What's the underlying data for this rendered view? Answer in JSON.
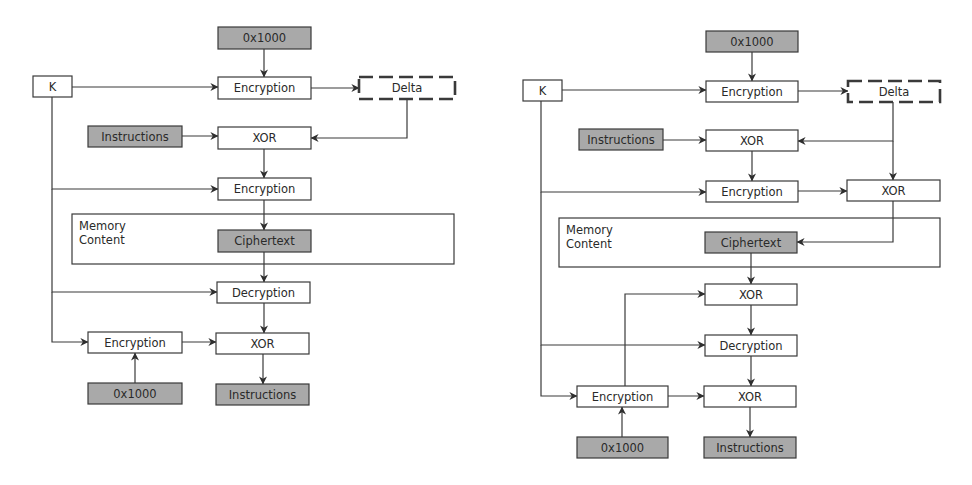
{
  "colors": {
    "box_fill": "#ffffff",
    "shaded_fill": "#a9a9a9",
    "stroke": "#3a3a3a",
    "text": "#2a2a2a",
    "background": "#ffffff"
  },
  "diagrams": [
    {
      "id": "left-scheme",
      "memory_label": [
        "Memory",
        "Content"
      ],
      "memory_box": {
        "x": 72,
        "y": 214,
        "w": 382,
        "h": 50
      },
      "nodes": [
        {
          "id": "k",
          "label": "K",
          "x": 33,
          "y": 76,
          "w": 39,
          "h": 21,
          "style": "plain"
        },
        {
          "id": "addr-top",
          "label": "0x1000",
          "x": 218,
          "y": 27,
          "w": 93,
          "h": 22,
          "style": "shaded"
        },
        {
          "id": "enc1",
          "label": "Encryption",
          "x": 218,
          "y": 77,
          "w": 93,
          "h": 22,
          "style": "plain"
        },
        {
          "id": "delta",
          "label": "Delta",
          "x": 359,
          "y": 77,
          "w": 96,
          "h": 22,
          "style": "dashed"
        },
        {
          "id": "instr-in",
          "label": "Instructions",
          "x": 88,
          "y": 126,
          "w": 94,
          "h": 21,
          "style": "shaded"
        },
        {
          "id": "xor1",
          "label": "XOR",
          "x": 218,
          "y": 127,
          "w": 93,
          "h": 22,
          "style": "plain"
        },
        {
          "id": "enc2",
          "label": "Encryption",
          "x": 218,
          "y": 178,
          "w": 93,
          "h": 22,
          "style": "plain"
        },
        {
          "id": "cipher",
          "label": "Ciphertext",
          "x": 218,
          "y": 230,
          "w": 93,
          "h": 22,
          "style": "shaded"
        },
        {
          "id": "dec",
          "label": "Decryption",
          "x": 217,
          "y": 282,
          "w": 93,
          "h": 21,
          "style": "plain"
        },
        {
          "id": "enc3",
          "label": "Encryption",
          "x": 88,
          "y": 332,
          "w": 94,
          "h": 21,
          "style": "plain"
        },
        {
          "id": "xor2",
          "label": "XOR",
          "x": 216,
          "y": 333,
          "w": 93,
          "h": 21,
          "style": "plain"
        },
        {
          "id": "addr-bot",
          "label": "0x1000",
          "x": 88,
          "y": 383,
          "w": 94,
          "h": 21,
          "style": "shaded"
        },
        {
          "id": "instr-out",
          "label": "Instructions",
          "x": 216,
          "y": 384,
          "w": 93,
          "h": 21,
          "style": "shaded"
        }
      ],
      "edges": [
        {
          "points": [
            [
              264,
              49
            ],
            [
              264,
              77
            ]
          ],
          "arrow": true
        },
        {
          "points": [
            [
              72,
              87
            ],
            [
              218,
              87
            ]
          ],
          "arrow": true
        },
        {
          "points": [
            [
              311,
              88
            ],
            [
              359,
              88
            ]
          ],
          "arrow": true
        },
        {
          "points": [
            [
              407,
              99
            ],
            [
              407,
              138
            ],
            [
              311,
              138
            ]
          ],
          "arrow": true
        },
        {
          "points": [
            [
              182,
              136
            ],
            [
              218,
              136
            ]
          ],
          "arrow": true
        },
        {
          "points": [
            [
              264,
              149
            ],
            [
              264,
              178
            ]
          ],
          "arrow": true
        },
        {
          "points": [
            [
              52,
              97
            ],
            [
              52,
              189
            ],
            [
              218,
              189
            ]
          ],
          "arrow": true
        },
        {
          "points": [
            [
              264,
              200
            ],
            [
              264,
              230
            ]
          ],
          "arrow": true
        },
        {
          "points": [
            [
              264,
              252
            ],
            [
              264,
              282
            ]
          ],
          "arrow": true
        },
        {
          "points": [
            [
              52,
              189
            ],
            [
              52,
              292
            ],
            [
              217,
              292
            ]
          ],
          "arrow": true
        },
        {
          "points": [
            [
              52,
              292
            ],
            [
              52,
              342
            ],
            [
              88,
              342
            ]
          ],
          "arrow": true
        },
        {
          "points": [
            [
              264,
              303
            ],
            [
              264,
              333
            ]
          ],
          "arrow": true
        },
        {
          "points": [
            [
              182,
              342
            ],
            [
              216,
              342
            ]
          ],
          "arrow": true
        },
        {
          "points": [
            [
              135,
              383
            ],
            [
              135,
              353
            ]
          ],
          "arrow": true
        },
        {
          "points": [
            [
              263,
              354
            ],
            [
              263,
              384
            ]
          ],
          "arrow": true
        }
      ]
    },
    {
      "id": "right-scheme",
      "memory_label": [
        "Memory",
        "Content"
      ],
      "memory_box": {
        "x": 559,
        "y": 218,
        "w": 381,
        "h": 49
      },
      "nodes": [
        {
          "id": "k",
          "label": "K",
          "x": 523,
          "y": 80,
          "w": 39,
          "h": 21,
          "style": "plain"
        },
        {
          "id": "addr-top",
          "label": "0x1000",
          "x": 706,
          "y": 31,
          "w": 92,
          "h": 21,
          "style": "shaded"
        },
        {
          "id": "enc1",
          "label": "Encryption",
          "x": 706,
          "y": 81,
          "w": 92,
          "h": 21,
          "style": "plain"
        },
        {
          "id": "delta",
          "label": "Delta",
          "x": 848,
          "y": 81,
          "w": 92,
          "h": 21,
          "style": "dashed"
        },
        {
          "id": "instr-in",
          "label": "Instructions",
          "x": 579,
          "y": 129,
          "w": 84,
          "h": 21,
          "style": "shaded"
        },
        {
          "id": "xor1",
          "label": "XOR",
          "x": 706,
          "y": 130,
          "w": 92,
          "h": 21,
          "style": "plain"
        },
        {
          "id": "enc2",
          "label": "Encryption",
          "x": 706,
          "y": 181,
          "w": 92,
          "h": 21,
          "style": "plain"
        },
        {
          "id": "xor-delta",
          "label": "XOR",
          "x": 847,
          "y": 180,
          "w": 93,
          "h": 21,
          "style": "plain"
        },
        {
          "id": "cipher",
          "label": "Ciphertext",
          "x": 705,
          "y": 232,
          "w": 92,
          "h": 21,
          "style": "shaded"
        },
        {
          "id": "xor2",
          "label": "XOR",
          "x": 705,
          "y": 284,
          "w": 92,
          "h": 21,
          "style": "plain"
        },
        {
          "id": "dec",
          "label": "Decryption",
          "x": 705,
          "y": 335,
          "w": 92,
          "h": 21,
          "style": "plain"
        },
        {
          "id": "enc3",
          "label": "Encryption",
          "x": 577,
          "y": 386,
          "w": 91,
          "h": 21,
          "style": "plain"
        },
        {
          "id": "xor3",
          "label": "XOR",
          "x": 704,
          "y": 386,
          "w": 92,
          "h": 21,
          "style": "plain"
        },
        {
          "id": "addr-bot",
          "label": "0x1000",
          "x": 577,
          "y": 437,
          "w": 91,
          "h": 21,
          "style": "shaded"
        },
        {
          "id": "instr-out",
          "label": "Instructions",
          "x": 704,
          "y": 437,
          "w": 92,
          "h": 21,
          "style": "shaded"
        }
      ],
      "edges": [
        {
          "points": [
            [
              752,
              52
            ],
            [
              752,
              81
            ]
          ],
          "arrow": true
        },
        {
          "points": [
            [
              562,
              90
            ],
            [
              706,
              90
            ]
          ],
          "arrow": true
        },
        {
          "points": [
            [
              798,
              91
            ],
            [
              848,
              91
            ]
          ],
          "arrow": true
        },
        {
          "points": [
            [
              893,
              102
            ],
            [
              893,
              141
            ],
            [
              798,
              141
            ]
          ],
          "arrow": true
        },
        {
          "points": [
            [
              893,
              141
            ],
            [
              893,
              180
            ]
          ],
          "arrow": true
        },
        {
          "points": [
            [
              663,
              140
            ],
            [
              706,
              140
            ]
          ],
          "arrow": true
        },
        {
          "points": [
            [
              752,
              151
            ],
            [
              752,
              181
            ]
          ],
          "arrow": true
        },
        {
          "points": [
            [
              541,
              101
            ],
            [
              541,
              192
            ],
            [
              706,
              192
            ]
          ],
          "arrow": true
        },
        {
          "points": [
            [
              798,
              191
            ],
            [
              847,
              191
            ]
          ],
          "arrow": true
        },
        {
          "points": [
            [
              893,
              201
            ],
            [
              893,
              242
            ],
            [
              797,
              242
            ]
          ],
          "arrow": true
        },
        {
          "points": [
            [
              751,
              253
            ],
            [
              751,
              284
            ]
          ],
          "arrow": true
        },
        {
          "points": [
            [
              625,
              386
            ],
            [
              625,
              294
            ],
            [
              705,
              294
            ]
          ],
          "arrow": true
        },
        {
          "points": [
            [
              751,
              305
            ],
            [
              751,
              335
            ]
          ],
          "arrow": true
        },
        {
          "points": [
            [
              541,
              192
            ],
            [
              541,
              345
            ],
            [
              705,
              345
            ]
          ],
          "arrow": true
        },
        {
          "points": [
            [
              541,
              345
            ],
            [
              541,
              396
            ],
            [
              577,
              396
            ]
          ],
          "arrow": true
        },
        {
          "points": [
            [
              751,
              356
            ],
            [
              751,
              386
            ]
          ],
          "arrow": true
        },
        {
          "points": [
            [
              668,
              396
            ],
            [
              704,
              396
            ]
          ],
          "arrow": true
        },
        {
          "points": [
            [
              622,
              437
            ],
            [
              622,
              407
            ]
          ],
          "arrow": true
        },
        {
          "points": [
            [
              750,
              407
            ],
            [
              750,
              437
            ]
          ],
          "arrow": true
        }
      ]
    }
  ]
}
